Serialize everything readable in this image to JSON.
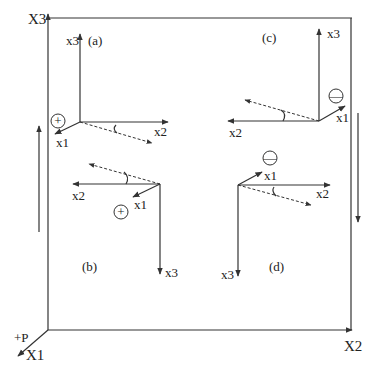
{
  "global_axes": {
    "x1": "X1",
    "x2": "X2",
    "x3": "X3",
    "load": "+P"
  },
  "panels": [
    {
      "id": "a",
      "label": "(a)",
      "x1": "x1",
      "x2": "x2",
      "x3": "x3",
      "sign": "+"
    },
    {
      "id": "b",
      "label": "(b)",
      "x1": "x1",
      "x2": "x2",
      "x3": "x3",
      "sign": "+"
    },
    {
      "id": "c",
      "label": "(c)",
      "x1": "x1",
      "x2": "x2",
      "x3": "x3",
      "sign": "—"
    },
    {
      "id": "d",
      "label": "(d)",
      "x1": "x1",
      "x2": "x2",
      "x3": "x3",
      "sign": "—"
    }
  ]
}
